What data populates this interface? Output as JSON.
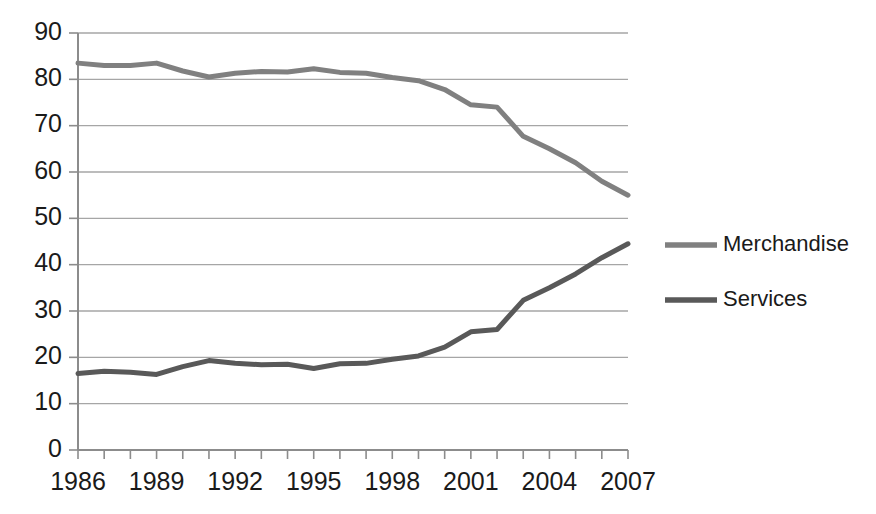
{
  "chart_data": {
    "type": "line",
    "title": "",
    "subtitle": "",
    "xlabel": "",
    "ylabel": "",
    "x": [
      1986,
      1987,
      1988,
      1989,
      1990,
      1991,
      1992,
      1993,
      1994,
      1995,
      1996,
      1997,
      1998,
      1999,
      2000,
      2001,
      2002,
      2003,
      2004,
      2005,
      2006,
      2007
    ],
    "xlim": [
      1986,
      2007
    ],
    "ylim": [
      0,
      90
    ],
    "y_ticks": [
      0,
      10,
      20,
      30,
      40,
      50,
      60,
      70,
      80,
      90
    ],
    "x_tick_labels": [
      "1986",
      "1989",
      "1992",
      "1995",
      "1998",
      "2001",
      "2004",
      "2007"
    ],
    "x_tick_values": [
      1986,
      1989,
      1992,
      1995,
      1998,
      2001,
      2004,
      2007
    ],
    "grid": "horizontal",
    "legend_position": "right",
    "series": [
      {
        "name": "Merchandise",
        "color": "#808080",
        "values": [
          83.5,
          83.0,
          83.0,
          83.5,
          81.8,
          80.5,
          81.3,
          81.7,
          81.6,
          82.3,
          81.5,
          81.3,
          80.4,
          79.7,
          77.8,
          74.5,
          74.0,
          67.7,
          65.0,
          62.0,
          58.0,
          55.0
        ]
      },
      {
        "name": "Services",
        "color": "#595959",
        "values": [
          16.5,
          17.0,
          16.8,
          16.3,
          18.0,
          19.3,
          18.7,
          18.4,
          18.5,
          17.6,
          18.6,
          18.7,
          19.6,
          20.3,
          22.2,
          25.5,
          26.0,
          32.3,
          35.0,
          38.0,
          41.5,
          44.5
        ]
      }
    ],
    "legend": [
      {
        "label": "Merchandise",
        "color": "#808080"
      },
      {
        "label": "Services",
        "color": "#595959"
      }
    ],
    "axis_color": "#8c8c8c",
    "grid_color": "#a6a6a6",
    "background_color": "#ffffff"
  }
}
